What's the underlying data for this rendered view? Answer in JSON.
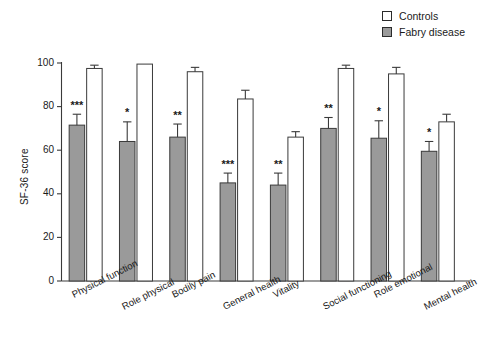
{
  "chart_data": {
    "type": "bar",
    "title": "",
    "subtitle": "",
    "xlabel": "",
    "ylabel": "SF-36 score",
    "ylim": [
      0,
      100
    ],
    "yticks": [
      0,
      20,
      40,
      60,
      80,
      100
    ],
    "grid": false,
    "legend_position": "top-right",
    "categories": [
      "Physical function",
      "Role physical",
      "Bodily pain",
      "General health",
      "Vitality",
      "Social functioning",
      "Role emotional",
      "Mental health"
    ],
    "series": [
      {
        "name": "Fabry disease",
        "color": "#9a9a9a",
        "values": [
          71.5,
          64.0,
          66.0,
          45.0,
          44.0,
          70.0,
          65.5,
          59.5
        ],
        "errors": [
          5.0,
          9.0,
          6.0,
          4.5,
          5.5,
          5.0,
          8.0,
          4.5
        ],
        "significance": [
          "***",
          "*",
          "**",
          "***",
          "**",
          "**",
          "*",
          "*"
        ]
      },
      {
        "name": "Controls",
        "color": "#ffffff",
        "values": [
          97.5,
          99.5,
          96.0,
          83.5,
          66.0,
          97.5,
          95.0,
          73.0
        ],
        "errors": [
          1.5,
          0.0,
          2.0,
          4.0,
          2.5,
          1.5,
          3.0,
          3.5
        ],
        "significance": [
          "",
          "",
          "",
          "",
          "",
          "",
          "",
          ""
        ]
      }
    ]
  },
  "legend": {
    "items": [
      {
        "label": "Controls",
        "swatch": "open-square"
      },
      {
        "label": "Fabry disease",
        "swatch": "filled-square"
      }
    ]
  },
  "axes": {
    "y_axis_label": "SF-36 score",
    "y_tick_labels": [
      "0",
      "20",
      "40",
      "60",
      "80",
      "100"
    ]
  },
  "colors": {
    "fabry_fill": "#9a9a9a",
    "control_fill": "#ffffff",
    "stroke": "#3a3a3a",
    "text": "#1a1a1a"
  }
}
